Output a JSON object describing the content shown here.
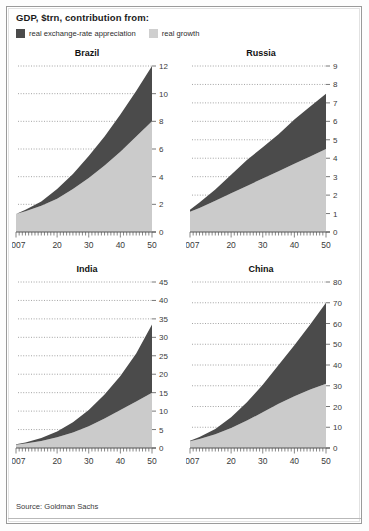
{
  "header": {
    "title": "GDP, $trn, contribution from:",
    "legend": [
      {
        "label": "real exchange-rate appreciation",
        "color": "#4b4b4b",
        "key": "fx"
      },
      {
        "label": "real growth",
        "color": "#cfcfcf",
        "key": "growth"
      }
    ]
  },
  "footer": {
    "source": "Source: Goldman Sachs"
  },
  "colors": {
    "dark": "#4b4b4b",
    "light": "#cbcbcb",
    "axis": "#555555",
    "grid": "#8d8d8d",
    "tick_text": "#3a3a3a"
  },
  "chart_data": [
    {
      "type": "area",
      "title": "Brazil",
      "stacked": true,
      "xlabel": "",
      "ylabel": "",
      "grid": true,
      "legend_position": "top",
      "xlim": [
        2007,
        2050
      ],
      "ylim": [
        0,
        12
      ],
      "yticks": [
        0,
        2,
        4,
        6,
        8,
        10,
        12
      ],
      "xticks": [
        2007,
        2020,
        2030,
        2040,
        2050
      ],
      "xticklabels": [
        "2007",
        "20",
        "30",
        "40",
        "50"
      ],
      "x": [
        2007,
        2010,
        2015,
        2020,
        2025,
        2030,
        2035,
        2040,
        2045,
        2050
      ],
      "series": [
        {
          "name": "real growth",
          "color": "#cbcbcb",
          "values": [
            1.3,
            1.5,
            1.9,
            2.4,
            3.1,
            3.9,
            4.8,
            5.8,
            6.9,
            8.0
          ]
        },
        {
          "name": "real exchange-rate appreciation",
          "color": "#4b4b4b",
          "values": [
            0.0,
            0.1,
            0.3,
            0.7,
            1.1,
            1.6,
            2.1,
            2.7,
            3.3,
            4.0
          ]
        }
      ],
      "totals": [
        1.3,
        1.6,
        2.2,
        3.1,
        4.2,
        5.5,
        6.9,
        8.5,
        10.2,
        12.0
      ]
    },
    {
      "type": "area",
      "title": "Russia",
      "stacked": true,
      "xlabel": "",
      "ylabel": "",
      "grid": true,
      "legend_position": "top",
      "xlim": [
        2007,
        2050
      ],
      "ylim": [
        0,
        9
      ],
      "yticks": [
        0,
        1,
        2,
        3,
        4,
        5,
        6,
        7,
        8,
        9
      ],
      "xticks": [
        2007,
        2020,
        2030,
        2040,
        2050
      ],
      "xticklabels": [
        "2007",
        "20",
        "30",
        "40",
        "50"
      ],
      "x": [
        2007,
        2010,
        2015,
        2020,
        2025,
        2030,
        2035,
        2040,
        2045,
        2050
      ],
      "series": [
        {
          "name": "real growth",
          "color": "#cbcbcb",
          "values": [
            1.1,
            1.3,
            1.7,
            2.1,
            2.5,
            2.9,
            3.3,
            3.7,
            4.1,
            4.5
          ]
        },
        {
          "name": "real exchange-rate appreciation",
          "color": "#4b4b4b",
          "values": [
            0.1,
            0.3,
            0.6,
            1.0,
            1.4,
            1.7,
            2.0,
            2.4,
            2.7,
            3.0
          ]
        }
      ],
      "totals": [
        1.2,
        1.6,
        2.3,
        3.1,
        3.9,
        4.6,
        5.3,
        6.1,
        6.8,
        7.5
      ]
    },
    {
      "type": "area",
      "title": "India",
      "stacked": true,
      "xlabel": "",
      "ylabel": "",
      "grid": true,
      "legend_position": "top",
      "xlim": [
        2007,
        2050
      ],
      "ylim": [
        0,
        45
      ],
      "yticks": [
        0,
        5,
        10,
        15,
        20,
        25,
        30,
        35,
        40,
        45
      ],
      "xticks": [
        2007,
        2020,
        2030,
        2040,
        2050
      ],
      "xticklabels": [
        "2007",
        "20",
        "30",
        "40",
        "50"
      ],
      "x": [
        2007,
        2010,
        2015,
        2020,
        2025,
        2030,
        2035,
        2040,
        2045,
        2050
      ],
      "series": [
        {
          "name": "real growth",
          "color": "#cbcbcb",
          "values": [
            0.9,
            1.2,
            1.9,
            2.9,
            4.2,
            5.9,
            8.0,
            10.3,
            12.6,
            15.0
          ]
        },
        {
          "name": "real exchange-rate appreciation",
          "color": "#4b4b4b",
          "values": [
            0.1,
            0.3,
            0.8,
            1.6,
            2.8,
            4.4,
            6.5,
            9.2,
            13.0,
            18.5
          ]
        }
      ],
      "totals": [
        1.0,
        1.5,
        2.7,
        4.5,
        7.0,
        10.3,
        14.5,
        19.5,
        25.6,
        33.5
      ]
    },
    {
      "type": "area",
      "title": "China",
      "stacked": true,
      "xlabel": "",
      "ylabel": "",
      "grid": true,
      "legend_position": "top",
      "xlim": [
        2007,
        2050
      ],
      "ylim": [
        0,
        80
      ],
      "yticks": [
        0,
        10,
        20,
        30,
        40,
        50,
        60,
        70,
        80
      ],
      "xticks": [
        2007,
        2020,
        2030,
        2040,
        2050
      ],
      "xticklabels": [
        "2007",
        "20",
        "30",
        "40",
        "50"
      ],
      "x": [
        2007,
        2010,
        2015,
        2020,
        2025,
        2030,
        2035,
        2040,
        2045,
        2050
      ],
      "series": [
        {
          "name": "real growth",
          "color": "#cbcbcb",
          "values": [
            3.2,
            4.3,
            6.6,
            9.6,
            13.2,
            17.2,
            21.3,
            25.0,
            28.2,
            31.0
          ]
        },
        {
          "name": "real exchange-rate appreciation",
          "color": "#4b4b4b",
          "values": [
            0.3,
            1.0,
            2.6,
            5.2,
            8.8,
            13.3,
            18.7,
            24.5,
            31.3,
            39.0
          ]
        }
      ],
      "totals": [
        3.5,
        5.3,
        9.2,
        14.8,
        22.0,
        30.5,
        40.0,
        49.5,
        59.5,
        70.0
      ]
    }
  ]
}
